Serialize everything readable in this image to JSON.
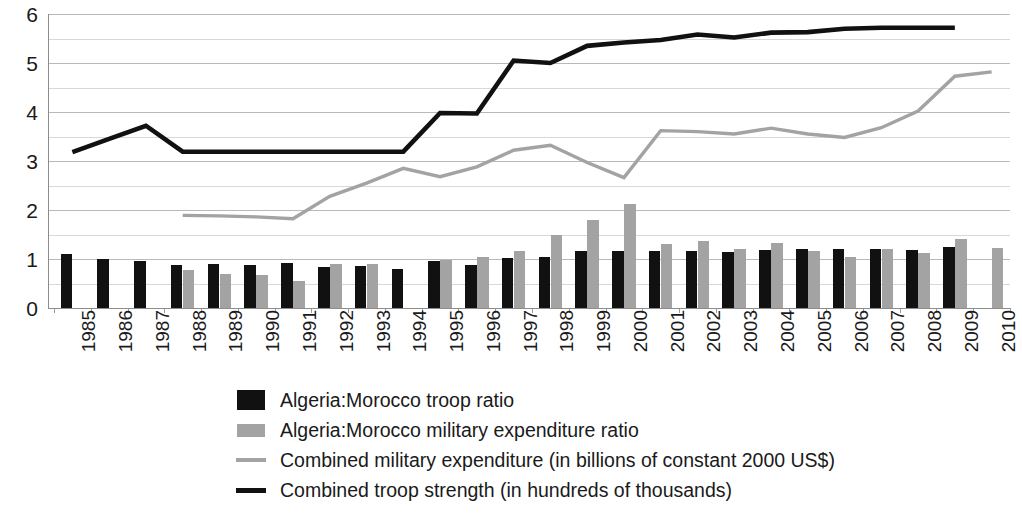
{
  "chart_data": {
    "type": "bar",
    "title": "",
    "subtitle": "",
    "xlabel": "",
    "ylabel": "",
    "ylim": [
      0,
      6
    ],
    "ytick_values": [
      0,
      1,
      2,
      3,
      4,
      5,
      6
    ],
    "ytick_labels": [
      "0",
      "1",
      "2",
      "3",
      "4",
      "5",
      "6"
    ],
    "minor_gridlines": [
      0.5,
      1.5,
      2.5,
      3.5,
      4.5,
      5.5
    ],
    "grid": true,
    "legend_position": "below-center",
    "categories": [
      "1985",
      "1986",
      "1987",
      "1988",
      "1989",
      "1990",
      "1991",
      "1992",
      "1993",
      "1994",
      "1995",
      "1996",
      "1997",
      "1998",
      "1999",
      "2000",
      "2001",
      "2002",
      "2003",
      "2004",
      "2005",
      "2006",
      "2007",
      "2008",
      "2009",
      "2010"
    ],
    "series": [
      {
        "name": "Algeria:Morocco troop ratio",
        "type": "bar",
        "color": "#111111",
        "values": [
          1.1,
          1.0,
          0.95,
          0.88,
          0.9,
          0.88,
          0.92,
          0.83,
          0.85,
          0.8,
          0.95,
          0.87,
          1.03,
          1.05,
          1.17,
          1.17,
          1.17,
          1.17,
          1.15,
          1.18,
          1.2,
          1.2,
          1.2,
          1.18,
          1.24,
          null
        ]
      },
      {
        "name": "Algeria:Morocco military expenditure ratio",
        "type": "bar",
        "color": "#a3a3a3",
        "values": [
          null,
          null,
          null,
          0.78,
          0.7,
          0.68,
          0.55,
          0.9,
          0.9,
          null,
          0.98,
          1.05,
          1.17,
          1.5,
          1.8,
          2.12,
          1.3,
          1.37,
          1.2,
          1.32,
          1.17,
          1.05,
          1.2,
          1.12,
          1.4,
          1.23
        ]
      },
      {
        "name": "Combined military expenditure (in billions of constant 2000 US$)",
        "type": "line",
        "color": "#a3a3a3",
        "values": [
          null,
          null,
          null,
          1.89,
          1.88,
          1.86,
          1.82,
          2.28,
          2.55,
          2.85,
          2.68,
          2.88,
          3.22,
          3.32,
          2.97,
          2.66,
          3.62,
          3.6,
          3.55,
          3.67,
          3.55,
          3.48,
          3.68,
          4.02,
          4.73,
          4.82
        ]
      },
      {
        "name": "Combined troop strength (in hundreds of thousands)",
        "type": "line",
        "color": "#111111",
        "values": [
          3.18,
          3.45,
          3.72,
          3.19,
          3.19,
          3.19,
          3.19,
          3.19,
          3.19,
          3.19,
          3.98,
          3.97,
          5.05,
          5.0,
          5.35,
          5.42,
          5.47,
          5.58,
          5.52,
          5.62,
          5.63,
          5.7,
          5.72,
          5.72,
          5.72,
          null
        ]
      }
    ]
  },
  "legend": {
    "items": [
      {
        "marker": "square-dark",
        "label": "Algeria:Morocco troop ratio"
      },
      {
        "marker": "square-light",
        "label": "Algeria:Morocco military expenditure ratio"
      },
      {
        "marker": "line-light",
        "label": "Combined military expenditure (in billions of constant 2000 US$)"
      },
      {
        "marker": "line-dark",
        "label": "Combined troop strength (in hundreds of thousands)"
      }
    ]
  },
  "colors": {
    "dark": "#111111",
    "light": "#a3a3a3",
    "grid": "#b9b9b9",
    "grid_minor": "#d8d8d8",
    "axis": "#8c8c8c",
    "background": "#ffffff",
    "text": "#1a1a1a"
  }
}
